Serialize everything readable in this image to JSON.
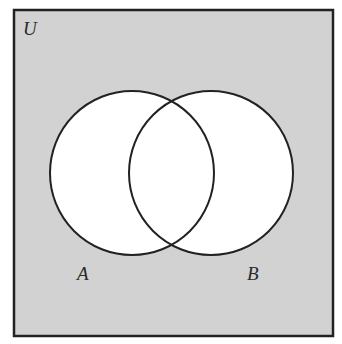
{
  "diagram": {
    "type": "venn",
    "universe": {
      "label": "U",
      "fill": "#d2d2d2",
      "stroke": "#222222"
    },
    "sets": [
      {
        "label": "A",
        "fill": "#ffffff",
        "stroke": "#222222"
      },
      {
        "label": "B",
        "fill": "#ffffff",
        "stroke": "#222222"
      }
    ],
    "shaded_region": "complement of (A ∪ B)"
  }
}
